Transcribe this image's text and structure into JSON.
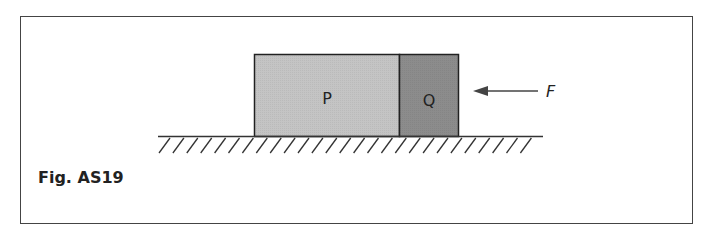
{
  "figure": {
    "caption": "Fig. AS19",
    "blocks": [
      {
        "label": "P",
        "fill": "#c4c4c4"
      },
      {
        "label": "Q",
        "fill": "#8c8c8c"
      }
    ],
    "force": {
      "label": "F",
      "direction": "left"
    },
    "ground": {
      "type": "hatched-surface"
    }
  }
}
